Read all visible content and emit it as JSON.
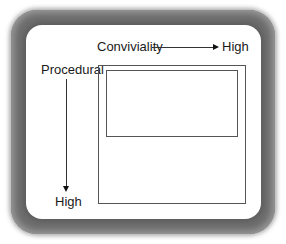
{
  "diagram": {
    "x_axis": {
      "label": "Conviviality",
      "end_label": "High"
    },
    "y_axis": {
      "label": "Procedural",
      "end_label": "High"
    },
    "shapes": [
      {
        "name": "outer-square",
        "description": "large outer rectangle"
      },
      {
        "name": "inner-rectangle",
        "description": "smaller rectangle nested at top of outer square"
      }
    ],
    "colors": {
      "frame": "#6e6e6e",
      "card": "#ffffff",
      "lines": "#333333"
    }
  }
}
